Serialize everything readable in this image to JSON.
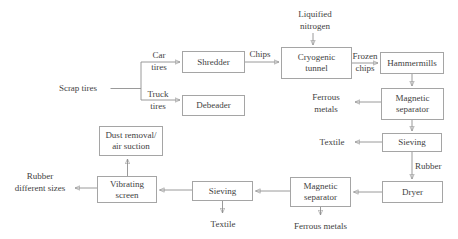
{
  "diagram": {
    "type": "flowchart",
    "colors": {
      "background": "#ffffff",
      "box_border": "#a5a5a5",
      "line": "#8f8f8f",
      "text": "#424242"
    },
    "nodes": {
      "shredder": "Shredder",
      "debeader": "Debeader",
      "cryogenic_tunnel": [
        "Cryogenic",
        "tunnel"
      ],
      "hammermills": "Hammermills",
      "magnetic_separator_1": [
        "Magnetic",
        "separator"
      ],
      "sieving_1": "Sieving",
      "dryer": "Dryer",
      "magnetic_separator_2": [
        "Magnetic",
        "separator"
      ],
      "sieving_2": "Sieving",
      "vibrating_screen": [
        "Vibrating",
        "screen"
      ],
      "dust_removal": [
        "Dust removal/",
        "air suction"
      ]
    },
    "labels": {
      "scrap_tires": "Scrap tires",
      "car_tires": [
        "Car",
        "tires"
      ],
      "truck_tires": [
        "Truck",
        "tires"
      ],
      "chips": "Chips",
      "liquified_nitrogen": [
        "Liquified",
        "nitrogen"
      ],
      "frozen_chips": [
        "Frozen",
        "chips"
      ],
      "ferrous_metals_1": [
        "Ferrous",
        "metals"
      ],
      "textile_1": "Textile",
      "rubber_1": "Rubber",
      "ferrous_metals_2": "Ferrous metals",
      "textile_2": "Textile",
      "rubber_different_sizes": [
        "Rubber",
        "different sizes"
      ]
    }
  }
}
